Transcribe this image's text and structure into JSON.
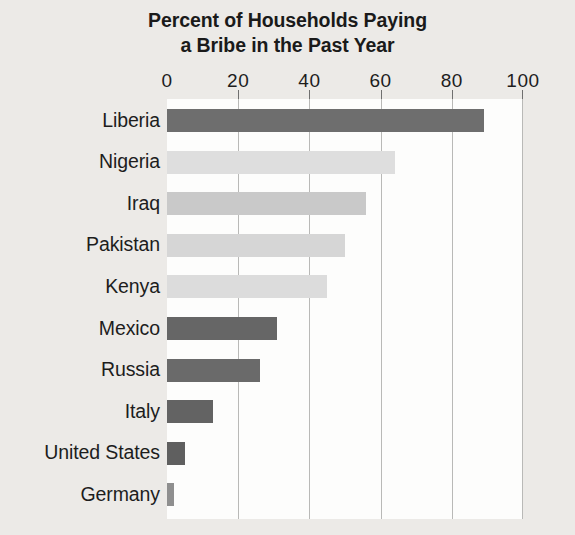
{
  "chart_data": {
    "type": "bar",
    "orientation": "horizontal",
    "title": "Percent of Households Paying a Bribe in the Past Year",
    "title_lines": [
      "Percent of Households Paying",
      "a Bribe in the Past Year"
    ],
    "xlabel": "",
    "ylabel": "",
    "xlim": [
      0,
      100
    ],
    "xticks": [
      0,
      20,
      40,
      60,
      80,
      100
    ],
    "xtick_labels": [
      "0",
      "20",
      "40",
      "60",
      "80",
      "100"
    ],
    "grid": "vertical",
    "legend": "none",
    "categories": [
      "Liberia",
      "Nigeria",
      "Iraq",
      "Pakistan",
      "Kenya",
      "Mexico",
      "Russia",
      "Italy",
      "United States",
      "Germany"
    ],
    "values": [
      89,
      64,
      56,
      50,
      45,
      31,
      26,
      13,
      5,
      2
    ],
    "bar_colors": [
      "#6e6e6e",
      "#dedede",
      "#c9c9c9",
      "#d6d6d6",
      "#dcdcdc",
      "#666666",
      "#6a6a6a",
      "#636363",
      "#5f5f5f",
      "#8f8f8f"
    ],
    "bars": [
      {
        "label": "Liberia",
        "value": 89,
        "color": "#6e6e6e"
      },
      {
        "label": "Nigeria",
        "value": 64,
        "color": "#dedede"
      },
      {
        "label": "Iraq",
        "value": 56,
        "color": "#c9c9c9"
      },
      {
        "label": "Pakistan",
        "value": 50,
        "color": "#d6d6d6"
      },
      {
        "label": "Kenya",
        "value": 45,
        "color": "#dcdcdc"
      },
      {
        "label": "Mexico",
        "value": 31,
        "color": "#666666"
      },
      {
        "label": "Russia",
        "value": 26,
        "color": "#6a6a6a"
      },
      {
        "label": "Italy",
        "value": 13,
        "color": "#636363"
      },
      {
        "label": "United States",
        "value": 5,
        "color": "#5f5f5f"
      },
      {
        "label": "Germany",
        "value": 2,
        "color": "#8f8f8f"
      }
    ],
    "colors": {
      "page_background": "#eceae7",
      "plot_background": "#fdfdfc",
      "gridline": "#b9b9b7",
      "text": "#1d1d1d"
    }
  }
}
